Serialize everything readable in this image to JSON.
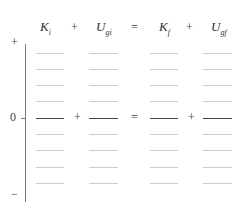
{
  "header": {
    "terms": [
      {
        "symbol": "K",
        "sub": "i"
      },
      {
        "symbol": "U",
        "sub": "gi"
      },
      {
        "symbol": "K",
        "sub": "f"
      },
      {
        "symbol": "U",
        "sub": "gf"
      }
    ],
    "ops": [
      "+",
      "=",
      "+"
    ]
  },
  "axis": {
    "top_label": "+",
    "zero_label": "0",
    "bottom_label": "−"
  },
  "zero_row_ops": [
    "+",
    "=",
    "+"
  ],
  "rows": {
    "count": 9,
    "zero_index": 4
  }
}
